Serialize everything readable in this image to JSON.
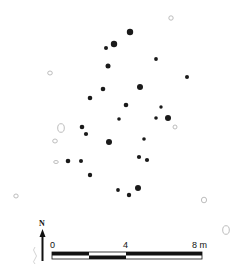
{
  "figure": {
    "type": "archaeological site plan",
    "colors": {
      "posthole_fill": "#1a1a1a",
      "open_feature_stroke": "#b5b5b5",
      "ink": "#111111"
    }
  },
  "postholes": [
    {
      "x": 130,
      "y": 32,
      "r": 3.2
    },
    {
      "x": 114,
      "y": 44,
      "r": 3.2
    },
    {
      "x": 106,
      "y": 48,
      "r": 2.0
    },
    {
      "x": 108,
      "y": 66,
      "r": 2.5
    },
    {
      "x": 156,
      "y": 59,
      "r": 1.9
    },
    {
      "x": 187,
      "y": 77,
      "r": 2.0
    },
    {
      "x": 103,
      "y": 89,
      "r": 2.3
    },
    {
      "x": 90,
      "y": 98,
      "r": 2.3
    },
    {
      "x": 140,
      "y": 87,
      "r": 3.0
    },
    {
      "x": 126,
      "y": 105,
      "r": 2.3
    },
    {
      "x": 119,
      "y": 119,
      "r": 1.8
    },
    {
      "x": 161,
      "y": 107,
      "r": 1.7
    },
    {
      "x": 156,
      "y": 118,
      "r": 1.8
    },
    {
      "x": 168,
      "y": 118,
      "r": 3.0
    },
    {
      "x": 82,
      "y": 127,
      "r": 2.3
    },
    {
      "x": 86,
      "y": 134,
      "r": 2.1
    },
    {
      "x": 109,
      "y": 142,
      "r": 3.0
    },
    {
      "x": 144,
      "y": 139,
      "r": 1.8
    },
    {
      "x": 68,
      "y": 161,
      "r": 2.3
    },
    {
      "x": 81,
      "y": 161,
      "r": 2.0
    },
    {
      "x": 139,
      "y": 157,
      "r": 2.1
    },
    {
      "x": 147,
      "y": 160,
      "r": 2.1
    },
    {
      "x": 90,
      "y": 175,
      "r": 2.2
    },
    {
      "x": 118,
      "y": 190,
      "r": 1.9
    },
    {
      "x": 129,
      "y": 195,
      "r": 2.2
    },
    {
      "x": 138,
      "y": 188,
      "r": 3.0
    }
  ],
  "open_features": [
    {
      "x": 171,
      "y": 18,
      "rx": 2.2,
      "ry": 2.2
    },
    {
      "x": 50,
      "y": 73,
      "rx": 2.3,
      "ry": 2.0
    },
    {
      "x": 61,
      "y": 128,
      "rx": 3.3,
      "ry": 4.3
    },
    {
      "x": 175,
      "y": 127,
      "rx": 2.0,
      "ry": 2.0
    },
    {
      "x": 55,
      "y": 141,
      "rx": 2.3,
      "ry": 2.0
    },
    {
      "x": 56,
      "y": 162,
      "rx": 2.3,
      "ry": 1.5
    },
    {
      "x": 16,
      "y": 196,
      "rx": 2.2,
      "ry": 2.0
    },
    {
      "x": 204,
      "y": 200,
      "rx": 2.6,
      "ry": 2.8
    },
    {
      "x": 226,
      "y": 230,
      "rx": 3.3,
      "ry": 4.3
    }
  ],
  "north_arrow": {
    "label": "N"
  },
  "scale_bar": {
    "labels": [
      "0",
      "4",
      "8 m"
    ],
    "unit": "m",
    "length_m": 8
  }
}
